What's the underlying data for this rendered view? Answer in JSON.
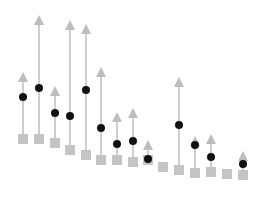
{
  "chart_data": {
    "type": "scatter",
    "title": "",
    "xlabel": "",
    "ylabel": "",
    "grid": false,
    "legend": null,
    "colors": {
      "baseline_marker": "#c4c4c4",
      "arrow": "#b3b3b3",
      "arrow_head": "#bdbdbd",
      "point": "#111111",
      "background": "#ffffff"
    },
    "series": [
      {
        "name": "baseline (squares)",
        "marker": "square"
      },
      {
        "name": "target (arrowheads)",
        "marker": "triangle-up"
      },
      {
        "name": "value (circles)",
        "marker": "circle"
      }
    ],
    "points": [
      {
        "x": 23,
        "square_y": 139,
        "arrow_top_y": 72,
        "circle_y": 97
      },
      {
        "x": 39,
        "square_y": 139,
        "arrow_top_y": 15,
        "circle_y": 88
      },
      {
        "x": 55,
        "square_y": 143,
        "arrow_top_y": 86,
        "circle_y": 113
      },
      {
        "x": 70,
        "square_y": 150,
        "arrow_top_y": 20,
        "circle_y": 116
      },
      {
        "x": 86,
        "square_y": 155,
        "arrow_top_y": 24,
        "circle_y": 90
      },
      {
        "x": 101,
        "square_y": 160,
        "arrow_top_y": 67,
        "circle_y": 128
      },
      {
        "x": 117,
        "square_y": 160,
        "arrow_top_y": 112,
        "circle_y": 144
      },
      {
        "x": 133,
        "square_y": 162,
        "arrow_top_y": 108,
        "circle_y": 141
      },
      {
        "x": 148,
        "square_y": 160,
        "arrow_top_y": 140,
        "circle_y": 159
      },
      {
        "x": 163,
        "square_y": 167,
        "arrow_top_y": null,
        "circle_y": null
      },
      {
        "x": 179,
        "square_y": 170,
        "arrow_top_y": 77,
        "circle_y": 125
      },
      {
        "x": 195,
        "square_y": 173,
        "arrow_top_y": 136,
        "circle_y": 145
      },
      {
        "x": 211,
        "square_y": 172,
        "arrow_top_y": 134,
        "circle_y": 157
      },
      {
        "x": 227,
        "square_y": 174,
        "arrow_top_y": null,
        "circle_y": null
      },
      {
        "x": 243,
        "square_y": 175,
        "arrow_top_y": 151,
        "circle_y": 164
      }
    ]
  }
}
